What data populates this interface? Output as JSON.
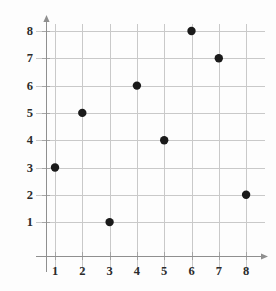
{
  "chart_data": {
    "type": "scatter",
    "title": "",
    "subtitle": "",
    "xlabel": "",
    "ylabel": "",
    "xlim": [
      0,
      8.6
    ],
    "ylim": [
      0,
      8.6
    ],
    "grid": true,
    "legend": false,
    "legend_position": "none",
    "marker": {
      "shape": "circle",
      "color": "#1a1a1a",
      "size_px": 8
    },
    "x_ticks": [
      1,
      2,
      3,
      4,
      5,
      6,
      7,
      8
    ],
    "y_ticks": [
      1,
      2,
      3,
      4,
      5,
      6,
      7,
      8
    ],
    "x_tick_labels": [
      "1",
      "2",
      "3",
      "4",
      "5",
      "6",
      "7",
      "8"
    ],
    "y_tick_labels": [
      "1",
      "2",
      "3",
      "4",
      "5",
      "6",
      "7",
      "8"
    ],
    "x": [
      1,
      2,
      3,
      4,
      5,
      6,
      7,
      8
    ],
    "y": [
      3,
      5,
      1,
      6,
      4,
      8,
      7,
      2
    ],
    "points": [
      {
        "x": 1,
        "y": 3
      },
      {
        "x": 2,
        "y": 5
      },
      {
        "x": 3,
        "y": 1
      },
      {
        "x": 4,
        "y": 6
      },
      {
        "x": 5,
        "y": 4
      },
      {
        "x": 6,
        "y": 8
      },
      {
        "x": 7,
        "y": 7
      },
      {
        "x": 8,
        "y": 2
      }
    ],
    "annotations": [],
    "axes": {
      "x_axis_arrow": true,
      "y_axis_arrow": true,
      "gridline_color": "#c9c9c9",
      "axis_color": "#8f8f8f",
      "background_color": "#fdfdfd"
    }
  }
}
